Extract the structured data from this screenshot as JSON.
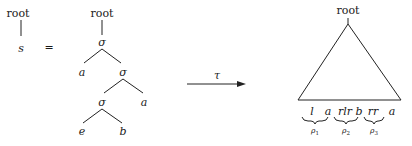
{
  "diagram": {
    "left_tree": {
      "root_label": "root",
      "child_label": "s"
    },
    "equals": "=",
    "expanded_tree": {
      "root_label": "root",
      "nodes": [
        {
          "id": "n1",
          "label": "σ"
        },
        {
          "id": "n2",
          "label": "a"
        },
        {
          "id": "n3",
          "label": "σ"
        },
        {
          "id": "n4",
          "label": "σ"
        },
        {
          "id": "n5",
          "label": "a"
        },
        {
          "id": "n6",
          "label": "e"
        },
        {
          "id": "n7",
          "label": "b"
        }
      ],
      "edges": [
        [
          "root",
          "n1"
        ],
        [
          "n1",
          "n2"
        ],
        [
          "n1",
          "n3"
        ],
        [
          "n3",
          "n4"
        ],
        [
          "n3",
          "n5"
        ],
        [
          "n4",
          "n6"
        ],
        [
          "n4",
          "n7"
        ]
      ]
    },
    "arrow": {
      "label": "τ"
    },
    "result_tree": {
      "root_label": "root",
      "shape": "triangle",
      "frontier": [
        "l",
        "a",
        "rlr",
        "b",
        "rr",
        "a"
      ],
      "braces": [
        {
          "over": "l",
          "label": "ρ",
          "sub": "1"
        },
        {
          "over": "rlr",
          "label": "ρ",
          "sub": "2"
        },
        {
          "over": "rr",
          "label": "ρ",
          "sub": "3"
        }
      ]
    }
  }
}
